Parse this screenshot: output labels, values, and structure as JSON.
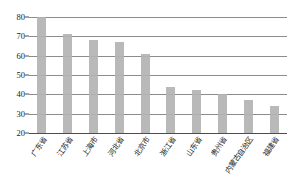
{
  "chart_data": {
    "type": "bar",
    "title": "",
    "subtitle": "",
    "xlabel": "",
    "ylabel": "",
    "categories": [
      "广东省",
      "江苏省",
      "上海市",
      "河北省",
      "北京市",
      "浙江省",
      "山东省",
      "贵州省",
      "内蒙古自治区",
      "福建省"
    ],
    "values": [
      80,
      71,
      68,
      67,
      61,
      44,
      42,
      40,
      37,
      34
    ],
    "ylim": [
      20,
      80
    ],
    "yticks": [
      20,
      30,
      40,
      50,
      60,
      70,
      80
    ],
    "ytick_labels": [
      "20",
      "30",
      "40",
      "50",
      "60",
      "70",
      "80"
    ],
    "grid": true,
    "legend": "none",
    "bar_color": "#b3b3b3",
    "gridline_color": "#8c8c8c",
    "axis_color": "#4d4d4d",
    "background_color": "#ffffff"
  }
}
